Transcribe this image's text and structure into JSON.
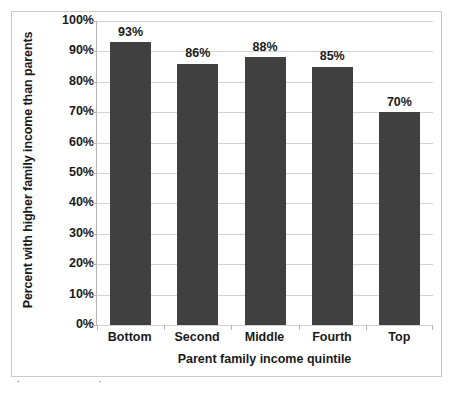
{
  "chart_data": {
    "type": "bar",
    "title": "",
    "xlabel": "Parent family income quintile",
    "ylabel": "Percent with higher family income than parents",
    "categories": [
      "Bottom",
      "Second",
      "Middle",
      "Fourth",
      "Top"
    ],
    "values": [
      93,
      86,
      88,
      85,
      70
    ],
    "value_labels": [
      "93%",
      "86%",
      "88%",
      "85%",
      "70%"
    ],
    "ylim": [
      0,
      100
    ],
    "ytick_values": [
      0,
      10,
      20,
      30,
      40,
      50,
      60,
      70,
      80,
      90,
      100
    ],
    "ytick_labels": [
      "0%",
      "10%",
      "20%",
      "30%",
      "40%",
      "50%",
      "60%",
      "70%",
      "80%",
      "90%",
      "100%"
    ],
    "grid": true,
    "legend": "none",
    "series": [
      {
        "name": "Percent with higher family income than parents",
        "values": [
          93,
          86,
          88,
          85,
          70
        ]
      }
    ],
    "colors": {
      "bar": "#404040",
      "gridline": "#d2d2d2",
      "axis": "#b6b6b6",
      "text": "#1a1a1a",
      "figure_border": "#c9c9c9",
      "background": "#ffffff"
    }
  },
  "caption": {
    "fragment": "partial cut-off caption text"
  }
}
